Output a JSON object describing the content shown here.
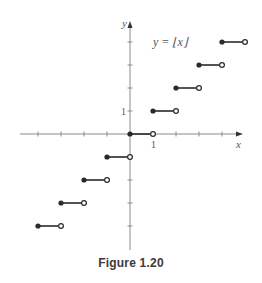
{
  "chart_data": {
    "type": "line",
    "title": "y = ⌊x⌋",
    "xlabel": "x",
    "ylabel": "y",
    "tick_labels": {
      "x": [
        "1"
      ],
      "y": [
        "1"
      ]
    },
    "xlim": [
      -4.5,
      4.5
    ],
    "ylim": [
      -5,
      5
    ],
    "grid": false,
    "legend": null,
    "segments": [
      {
        "x_start": -4,
        "x_end": -3,
        "y": -4,
        "closed_left": true,
        "open_right": true
      },
      {
        "x_start": -3,
        "x_end": -2,
        "y": -3,
        "closed_left": true,
        "open_right": true
      },
      {
        "x_start": -2,
        "x_end": -1,
        "y": -2,
        "closed_left": true,
        "open_right": true
      },
      {
        "x_start": -1,
        "x_end": 0,
        "y": -1,
        "closed_left": true,
        "open_right": true
      },
      {
        "x_start": 0,
        "x_end": 1,
        "y": 0,
        "closed_left": true,
        "open_right": true
      },
      {
        "x_start": 1,
        "x_end": 2,
        "y": 1,
        "closed_left": true,
        "open_right": true
      },
      {
        "x_start": 2,
        "x_end": 3,
        "y": 2,
        "closed_left": true,
        "open_right": true
      },
      {
        "x_start": 3,
        "x_end": 4,
        "y": 3,
        "closed_left": true,
        "open_right": true
      },
      {
        "x_start": 4,
        "x_end": 5,
        "y": 4,
        "closed_left": true,
        "open_right": true
      }
    ]
  },
  "labels": {
    "equation": "y = ⌊x⌋",
    "x_axis": "x",
    "y_axis": "y",
    "x_tick_one": "1",
    "y_tick_one": "1"
  },
  "caption": "Figure 1.20",
  "colors": {
    "axis": "#8a8a8a",
    "segment": "#2a2a2a",
    "text": "#555555"
  }
}
